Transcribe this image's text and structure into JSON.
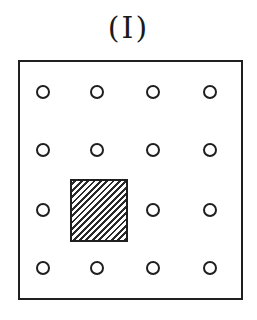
{
  "figure": {
    "label": "(I)",
    "grid": {
      "rows": 4,
      "cols": 4
    },
    "markers": [
      {
        "row": 0,
        "col": 0,
        "type": "circle"
      },
      {
        "row": 0,
        "col": 1,
        "type": "circle"
      },
      {
        "row": 0,
        "col": 2,
        "type": "circle"
      },
      {
        "row": 0,
        "col": 3,
        "type": "circle"
      },
      {
        "row": 1,
        "col": 0,
        "type": "circle"
      },
      {
        "row": 1,
        "col": 1,
        "type": "circle"
      },
      {
        "row": 1,
        "col": 2,
        "type": "circle"
      },
      {
        "row": 1,
        "col": 3,
        "type": "circle"
      },
      {
        "row": 2,
        "col": 0,
        "type": "circle"
      },
      {
        "row": 2,
        "col": 1,
        "type": "hatched-square"
      },
      {
        "row": 2,
        "col": 2,
        "type": "circle"
      },
      {
        "row": 2,
        "col": 3,
        "type": "circle"
      },
      {
        "row": 3,
        "col": 0,
        "type": "circle"
      },
      {
        "row": 3,
        "col": 1,
        "type": "circle"
      },
      {
        "row": 3,
        "col": 2,
        "type": "circle"
      },
      {
        "row": 3,
        "col": 3,
        "type": "circle"
      }
    ],
    "colors": {
      "stroke": "#1f1f1f",
      "background": "#ffffff"
    }
  }
}
